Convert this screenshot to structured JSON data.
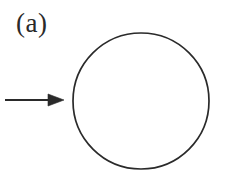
{
  "figure": {
    "panel_label": "(a)",
    "width": 228,
    "height": 182,
    "background_color": "#ffffff",
    "ink_color": "#2a2a2a",
    "elements": {
      "circle": {
        "name": "circle-outline",
        "center_x": 141,
        "center_y": 101,
        "radius": 68,
        "stroke_color": "#2a2a2a",
        "stroke_width": 1.7,
        "fill": "none"
      },
      "arrow": {
        "name": "incoming-arrow",
        "direction": "right",
        "shaft_start_x": 5,
        "shaft_end_x": 50,
        "y": 100,
        "tip_x": 64,
        "head_half_height": 6,
        "stroke_color": "#2a2a2a",
        "stroke_width": 1.8
      },
      "label": {
        "name": "panel-label",
        "text": "(a)",
        "x": 16,
        "y": 10,
        "font_size": 27,
        "color": "#2a2a2a"
      }
    }
  }
}
